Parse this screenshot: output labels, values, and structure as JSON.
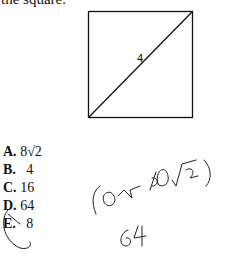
{
  "prompt": "the square.",
  "figure": {
    "diagonal_label": "4"
  },
  "options": [
    {
      "letter": "A.",
      "value": "8√2"
    },
    {
      "letter": "B.",
      "value": "  4"
    },
    {
      "letter": "C.",
      "value": "16"
    },
    {
      "letter": "D.",
      "value": "64"
    },
    {
      "letter": "E.",
      "value": "  8"
    }
  ],
  "handwriting": {
    "line1": "(8√2)(8√2)",
    "line2": "64",
    "circled_option": "D"
  }
}
